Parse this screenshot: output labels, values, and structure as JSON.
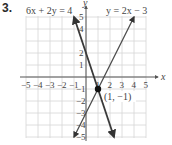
{
  "problem_number": "3.",
  "chart_data": {
    "type": "line",
    "title": "",
    "xlabel": "x",
    "ylabel": "y",
    "xlim": [
      -5,
      5
    ],
    "ylim": [
      -5,
      5
    ],
    "grid": true,
    "x_ticks": [
      "-5",
      "-4",
      "-3",
      "-2",
      "-1",
      "1",
      "2",
      "3",
      "4",
      "5"
    ],
    "y_ticks": [
      "5",
      "4",
      "2",
      "1",
      "-1",
      "-2",
      "-3",
      "-4",
      "-5"
    ],
    "series": [
      {
        "name": "6x + 2y = 4",
        "equation": "y = -3x + 2",
        "x": [
          -1,
          2.333
        ],
        "y": [
          5,
          -5
        ],
        "color": "#3a3a3a"
      },
      {
        "name": "y = 2x − 3",
        "equation": "y = 2x - 3",
        "x": [
          -1,
          4
        ],
        "y": [
          -5,
          5
        ],
        "color": "#4a4a4a"
      }
    ],
    "annotations": [
      {
        "label": "(1, −1)",
        "x": 1,
        "y": -1,
        "marker": "filled-circle"
      }
    ]
  },
  "labels": {
    "line1": "6x + 2y = 4",
    "line2": "y = 2x − 3",
    "point": "(1, −1)",
    "x_axis": "x",
    "y_axis": "y"
  }
}
